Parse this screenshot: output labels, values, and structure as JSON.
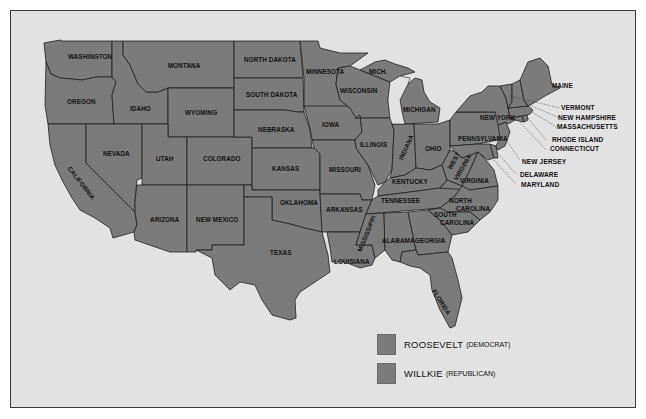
{
  "map": {
    "title": "1940 U.S. Presidential Election",
    "fill_color": "#7b7b7b",
    "background_color": "#e2e2e2",
    "states": [
      {
        "name": "WASHINGTON"
      },
      {
        "name": "OREGON"
      },
      {
        "name": "CALIFORNIA"
      },
      {
        "name": "IDAHO"
      },
      {
        "name": "NEVADA"
      },
      {
        "name": "MONTANA"
      },
      {
        "name": "WYOMING"
      },
      {
        "name": "UTAH"
      },
      {
        "name": "ARIZONA"
      },
      {
        "name": "COLORADO"
      },
      {
        "name": "NEW MEXICO"
      },
      {
        "name": "NORTH DAKOTA"
      },
      {
        "name": "SOUTH DAKOTA"
      },
      {
        "name": "NEBRASKA"
      },
      {
        "name": "KANSAS"
      },
      {
        "name": "OKLAHOMA"
      },
      {
        "name": "TEXAS"
      },
      {
        "name": "MINNESOTA"
      },
      {
        "name": "IOWA"
      },
      {
        "name": "MISSOURI"
      },
      {
        "name": "ARKANSAS"
      },
      {
        "name": "LOUISIANA"
      },
      {
        "name": "WISCONSIN"
      },
      {
        "name": "MICH."
      },
      {
        "name": "ILLINOIS"
      },
      {
        "name": "MISSISSIPPI"
      },
      {
        "name": "MICHIGAN"
      },
      {
        "name": "INDIANA"
      },
      {
        "name": "KENTUCKY"
      },
      {
        "name": "TENNESSEE"
      },
      {
        "name": "ALABAMA"
      },
      {
        "name": "OHIO"
      },
      {
        "name": "GEORGIA"
      },
      {
        "name": "FLORIDA"
      },
      {
        "name": "WEST VIRGINIA"
      },
      {
        "name": "VIRGINIA"
      },
      {
        "name": "NORTH CAROLINA"
      },
      {
        "name": "SOUTH CAROLINA"
      },
      {
        "name": "PENNSYLVANIA"
      },
      {
        "name": "NEW YORK"
      },
      {
        "name": "MAINE"
      },
      {
        "name": "VERMONT"
      },
      {
        "name": "NEW HAMPSHIRE"
      },
      {
        "name": "MASSACHUSETTS"
      },
      {
        "name": "RHODE ISLAND"
      },
      {
        "name": "CONNECTICUT"
      },
      {
        "name": "NEW JERSEY"
      },
      {
        "name": "DELAWARE"
      },
      {
        "name": "MARYLAND"
      }
    ],
    "labels": {
      "washington": "WASHINGTON",
      "oregon": "OREGON",
      "california": "CALIFORNIA",
      "idaho": "IDAHO",
      "nevada": "NEVADA",
      "montana": "MONTANA",
      "wyoming": "WYOMING",
      "utah": "UTAH",
      "arizona": "ARIZONA",
      "colorado": "COLORADO",
      "new_mexico": "NEW MEXICO",
      "north_dakota": "NORTH DAKOTA",
      "south_dakota": "SOUTH DAKOTA",
      "nebraska": "NEBRASKA",
      "kansas": "KANSAS",
      "oklahoma": "OKLAHOMA",
      "texas": "TEXAS",
      "minnesota": "MINNESOTA",
      "iowa": "IOWA",
      "missouri": "MISSOURI",
      "arkansas": "ARKANSAS",
      "louisiana": "LOUISIANA",
      "wisconsin": "WISCONSIN",
      "mich_up": "MICH.",
      "illinois": "ILLINOIS",
      "mississippi": "MISSISSIPPI",
      "michigan": "MICHIGAN",
      "indiana": "INDIANA",
      "kentucky": "KENTUCKY",
      "tennessee": "TENNESSEE",
      "alabama": "ALABAMA",
      "ohio": "OHIO",
      "georgia": "GEORGIA",
      "florida": "FLORIDA",
      "west_virginia_1": "WEST",
      "west_virginia_2": "VIRGINIA",
      "virginia": "VIRGINIA",
      "north_carolina_1": "NORTH",
      "north_carolina_2": "CAROLINA",
      "south_carolina_1": "SOUTH",
      "south_carolina_2": "CAROLINA",
      "pennsylvania": "PENNSYLVANIA",
      "new_york": "NEW YORK",
      "maine": "MAINE",
      "vermont": "VERMONT",
      "new_hampshire": "NEW HAMPSHIRE",
      "massachusetts": "MASSACHUSETTS",
      "rhode_island": "RHODE ISLAND",
      "connecticut": "CONNECTICUT",
      "new_jersey": "NEW JERSEY",
      "delaware": "DELAWARE",
      "maryland": "MARYLAND"
    }
  },
  "legend": {
    "items": [
      {
        "candidate": "ROOSEVELT",
        "party": "(DEMOCRAT)",
        "color": "#7b7b7b"
      },
      {
        "candidate": "WILLKIE",
        "party": "(REPUBLICAN)",
        "color": "#7b7b7b"
      }
    ]
  }
}
